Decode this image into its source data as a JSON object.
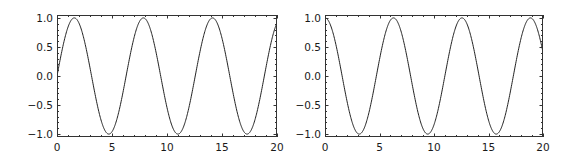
{
  "chart_data": [
    {
      "type": "line",
      "title": "",
      "xlabel": "",
      "ylabel": "",
      "function": "sin(x)",
      "xlim": [
        0,
        20
      ],
      "ylim": [
        -1.05,
        1.05
      ],
      "x_ticks": [
        0,
        5,
        10,
        15,
        20
      ],
      "x_tick_labels": [
        "0",
        "5",
        "10",
        "15",
        "20"
      ],
      "y_ticks": [
        1.0,
        0.5,
        0.0,
        -0.5,
        -1.0
      ],
      "y_tick_labels": [
        "1.0",
        "0.5",
        "0.0",
        "−0.5",
        "−1.0"
      ],
      "grid": false,
      "legend": null,
      "series": [
        {
          "name": "sin",
          "color": "#222222"
        }
      ],
      "frame": {
        "x0": 57,
        "y0": 15,
        "x1": 277,
        "y1": 137
      }
    },
    {
      "type": "line",
      "title": "",
      "xlabel": "",
      "ylabel": "",
      "function": "cos(x)",
      "xlim": [
        0,
        20
      ],
      "ylim": [
        -1.05,
        1.05
      ],
      "x_ticks": [
        0,
        5,
        10,
        15,
        20
      ],
      "x_tick_labels": [
        "0",
        "5",
        "10",
        "15",
        "20"
      ],
      "y_ticks": [
        1.0,
        0.5,
        0.0,
        -0.5,
        -1.0
      ],
      "y_tick_labels": [
        "1.0",
        "0.5",
        "0.0",
        "−0.5",
        "−1.0"
      ],
      "grid": false,
      "legend": null,
      "series": [
        {
          "name": "cos",
          "color": "#222222"
        }
      ],
      "frame": {
        "x0": 325,
        "y0": 15,
        "x1": 543,
        "y1": 137
      }
    }
  ]
}
